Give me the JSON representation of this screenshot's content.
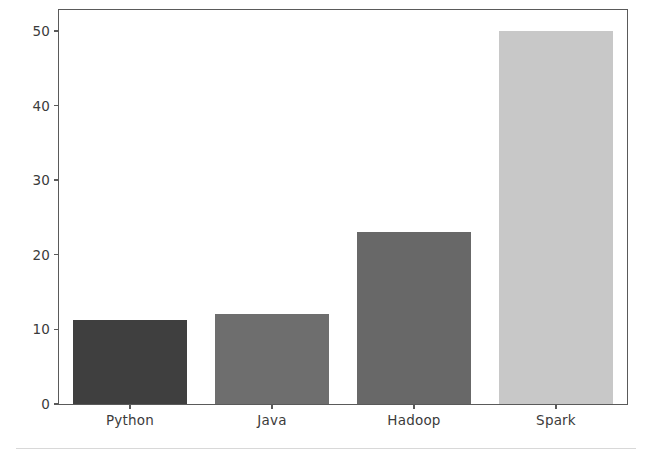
{
  "chart_data": {
    "type": "bar",
    "title": "",
    "subtitle": "",
    "xlabel": "",
    "ylabel": "",
    "categories": [
      "Python",
      "Java",
      "Hadoop",
      "Spark"
    ],
    "values": [
      11.2,
      12,
      23,
      50
    ],
    "series": [
      {
        "name": "",
        "values": [
          11.2,
          12,
          23,
          50
        ]
      }
    ],
    "bar_colors": [
      "#3f3f3f",
      "#6e6e6e",
      "#686868",
      "#c8c8c8"
    ],
    "ylim": [
      0,
      52.8
    ],
    "yticks": [
      0,
      10,
      20,
      30,
      40,
      50
    ],
    "ytick_labels": [
      "0",
      "10",
      "20",
      "30",
      "40",
      "50"
    ],
    "xtick_labels": [
      "Python",
      "Java",
      "Hadoop",
      "Spark"
    ],
    "grid": false,
    "legend": false,
    "legend_position": "none",
    "annotations": []
  },
  "figure": {
    "background_color": "#ffffff",
    "axes_edge_color": "#5a5a5a",
    "tick_color": "#3b3b3b",
    "footer_rule_color": "#d8d8d8"
  }
}
